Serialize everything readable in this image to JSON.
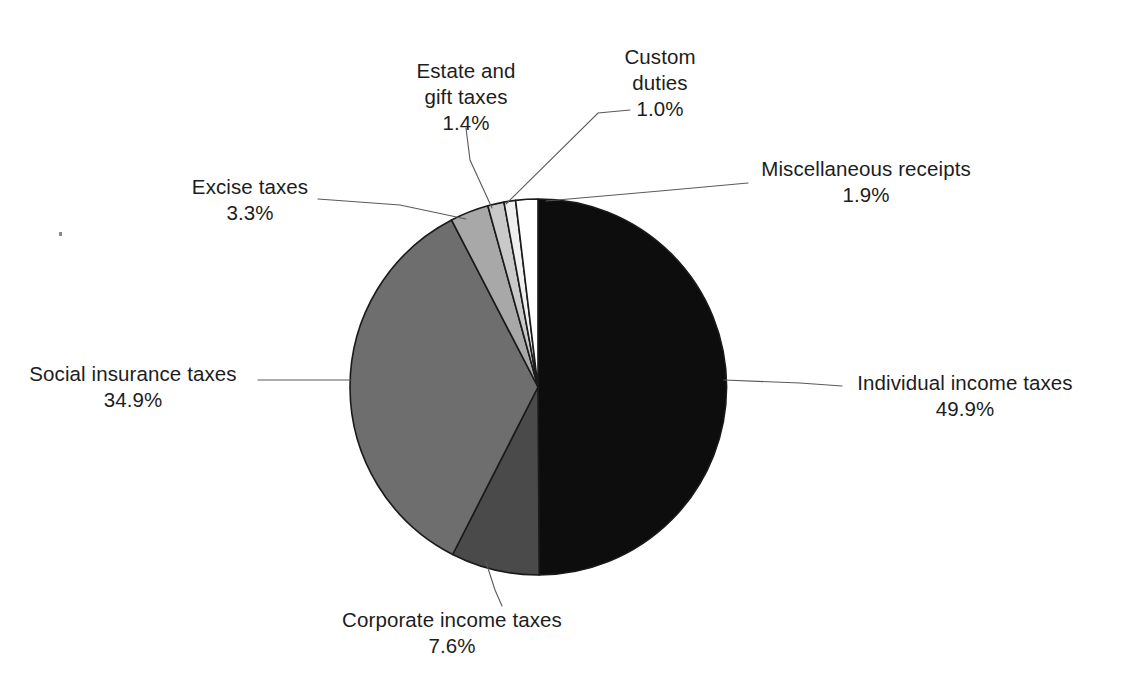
{
  "chart_data": {
    "type": "pie",
    "title": "",
    "subtitle": "",
    "xlabel": "",
    "ylabel": "",
    "legend_position": "none",
    "grid": false,
    "value_unit": "%",
    "label_format": "{name}\n{value}%",
    "start_angle_deg": 0,
    "direction": "clockwise",
    "categories": [
      "Individual income taxes",
      "Corporate income taxes",
      "Social insurance taxes",
      "Excise taxes",
      "Estate and gift taxes",
      "Custom duties",
      "Miscellaneous receipts"
    ],
    "values": [
      49.9,
      7.6,
      34.9,
      3.3,
      1.4,
      1.0,
      1.9
    ],
    "colors": [
      "#0d0d0d",
      "#4a4a4a",
      "#6e6e6e",
      "#a8a8a8",
      "#c9c9c9",
      "#efefef",
      "#ffffff"
    ],
    "slices": [
      {
        "name": "Individual income taxes",
        "value": 49.9,
        "value_label": "49.9%",
        "color": "#0d0d0d",
        "start_deg": 0,
        "end_deg": 179.64
      },
      {
        "name": "Corporate income taxes",
        "value": 7.6,
        "value_label": "7.6%",
        "color": "#4a4a4a",
        "start_deg": 179.64,
        "end_deg": 206.999
      },
      {
        "name": "Social insurance taxes",
        "value": 34.9,
        "value_label": "34.9%",
        "color": "#6e6e6e",
        "start_deg": 206.999,
        "end_deg": 332.639
      },
      {
        "name": "Excise taxes",
        "value": 3.3,
        "value_label": "3.3%",
        "color": "#a8a8a8",
        "start_deg": 332.639,
        "end_deg": 344.519
      },
      {
        "name": "Estate and gift taxes",
        "value": 1.4,
        "value_label": "1.4%",
        "color": "#c9c9c9",
        "start_deg": 344.519,
        "end_deg": 349.559
      },
      {
        "name": "Custom duties",
        "value": 1.0,
        "value_label": "1.0%",
        "color": "#efefef",
        "start_deg": 349.559,
        "end_deg": 353.159
      },
      {
        "name": "Miscellaneous receipts",
        "value": 1.9,
        "value_label": "1.9%",
        "color": "#ffffff",
        "start_deg": 353.159,
        "end_deg": 360.0
      }
    ]
  },
  "labels": {
    "individual_income_taxes": {
      "name": "Individual income taxes",
      "value": "49.9%"
    },
    "corporate_income_taxes": {
      "name": "Corporate income taxes",
      "value": "7.6%"
    },
    "social_insurance_taxes": {
      "name": "Social insurance taxes",
      "value": "34.9%"
    },
    "excise_taxes": {
      "name": "Excise taxes",
      "value": "3.3%"
    },
    "estate_and_gift_taxes": {
      "name_line1": "Estate and",
      "name_line2": "gift taxes",
      "value": "1.4%"
    },
    "custom_duties": {
      "name_line1": "Custom",
      "name_line2": "duties",
      "value": "1.0%"
    },
    "miscellaneous_receipts": {
      "name": "Miscellaneous receipts",
      "value": "1.9%"
    }
  }
}
